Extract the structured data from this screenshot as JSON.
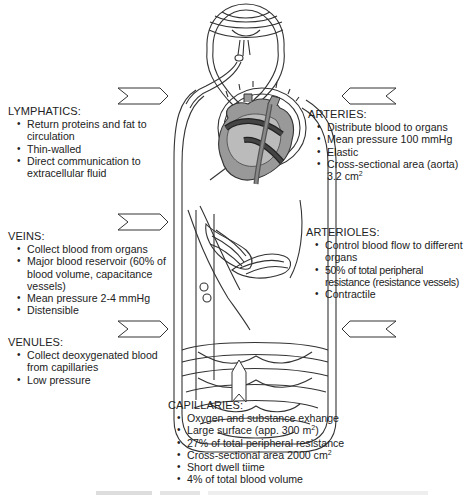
{
  "diagram": {
    "type": "circulatory-system-schematic",
    "arrows": [
      {
        "id": "lymphatics",
        "direction": "right"
      },
      {
        "id": "arteries",
        "direction": "left"
      },
      {
        "id": "veins",
        "direction": "right"
      },
      {
        "id": "arterioles",
        "direction": "left"
      },
      {
        "id": "venules",
        "direction": "right"
      },
      {
        "id": "capillaries",
        "direction": "up"
      }
    ]
  },
  "lymphatics": {
    "heading": "LYMPHATICS:",
    "items": [
      "Return proteins and fat to circulation",
      "Thin-walled",
      "Direct communication to extracellular fluid"
    ]
  },
  "veins": {
    "heading": "VEINS:",
    "items": [
      "Collect blood from organs",
      "Major blood reservoir (60% of blood volume, capacitance vessels)",
      "Mean pressure 2-4 mmHg",
      "Distensible"
    ]
  },
  "venules": {
    "heading": "VENULES:",
    "items": [
      "Collect deoxygenated blood from capillaries",
      "Low pressure"
    ]
  },
  "arteries": {
    "heading": "ARTERIES:",
    "items": [
      "Distribute blood to organs",
      "Mean pressure 100 mmHg",
      "Elastic"
    ],
    "area_prefix": "Cross-sectional area (aorta) 3.2 cm",
    "area_sup": "2"
  },
  "arterioles": {
    "heading": "ARTERIOLES:",
    "items": [
      "Control blood flow to different organs",
      "50% of total peripheral resistance (resistance vessels)",
      "Contractile"
    ]
  },
  "capillaries": {
    "heading": "CAPILLARIES:",
    "item1": "Oxygen and substance exhange",
    "item2_prefix": "Large surface (app. 300 m",
    "item2_sup": "2",
    "item2_suffix": ")",
    "item3": "27% of total peripheral resistance",
    "item4_prefix": "Cross-sectional area 2000 cm",
    "item4_sup": "2",
    "item5": "Short dwell tiime",
    "item6": "4% of total blood volume"
  }
}
